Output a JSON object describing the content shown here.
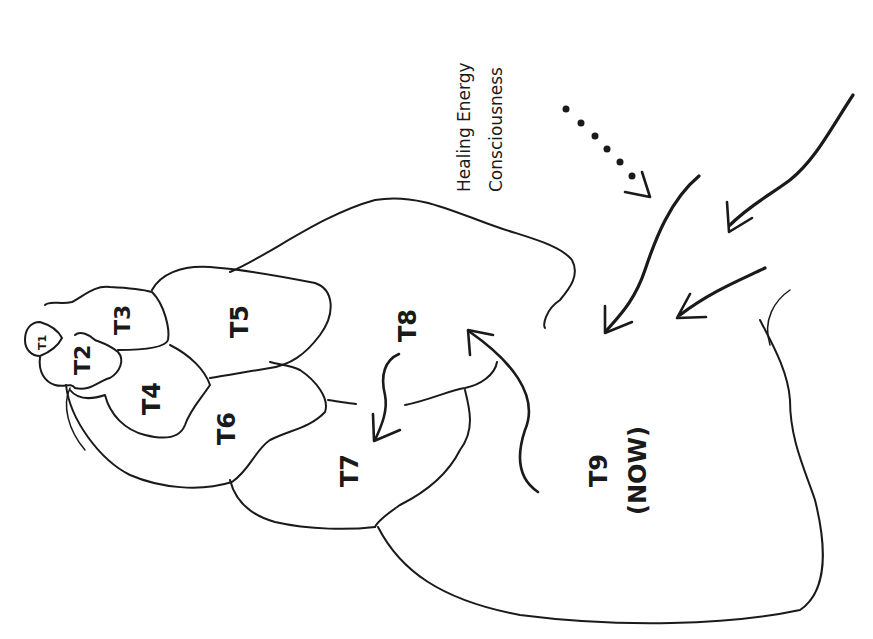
{
  "diagram": {
    "caption": {
      "line1": "Healing Energy",
      "line2": "Consciousness"
    },
    "regions": [
      {
        "id": "T1",
        "label": "T1"
      },
      {
        "id": "T2",
        "label": "T2"
      },
      {
        "id": "T3",
        "label": "T3"
      },
      {
        "id": "T4",
        "label": "T4"
      },
      {
        "id": "T5",
        "label": "T5"
      },
      {
        "id": "T6",
        "label": "T6"
      },
      {
        "id": "T7",
        "label": "T7"
      },
      {
        "id": "T8",
        "label": "T8"
      },
      {
        "id": "T9",
        "label": "T9",
        "sublabel": "(NOW)"
      }
    ],
    "arrows": [
      {
        "name": "dotted-incoming-arrow",
        "style": "dotted"
      },
      {
        "name": "incoming-arrow-1",
        "style": "solid"
      },
      {
        "name": "incoming-arrow-2",
        "style": "solid"
      },
      {
        "name": "incoming-arrow-3",
        "style": "solid"
      },
      {
        "name": "t8-to-t7-arrow",
        "style": "solid"
      },
      {
        "name": "t9-to-t8-arrow",
        "style": "solid"
      }
    ],
    "orientation": "rotated -90deg (text reads bottom-to-top)"
  }
}
